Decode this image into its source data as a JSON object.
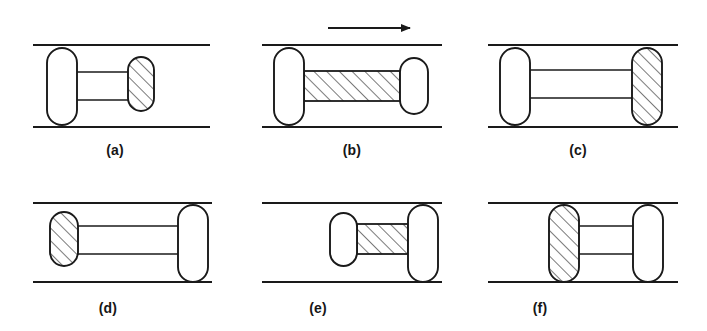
{
  "figure": {
    "type": "diagram",
    "background_color": "#ffffff",
    "line_color": "#1a1a1a",
    "hatch_color": "#333333",
    "panels": [
      {
        "id": "a",
        "label": "(a)",
        "label_x": 115,
        "label_y": 142,
        "wall_top_y": 45,
        "wall_bottom_y": 127,
        "wall_x_start": 33,
        "wall_x_end": 210,
        "arrow": null,
        "left_lobe": {
          "x": 47,
          "y": 48,
          "w": 30,
          "h": 77,
          "hatched": false,
          "spans_channel": true
        },
        "right_lobe": {
          "x": 128,
          "y": 57,
          "w": 26,
          "h": 54,
          "hatched": true,
          "spans_channel": false
        },
        "connector": {
          "style": "two-rods",
          "x1": 77,
          "x2": 128,
          "rod_top_y": 72,
          "rod_bottom_y": 100,
          "hatched": false
        }
      },
      {
        "id": "b",
        "label": "(b)",
        "label_x": 352,
        "label_y": 142,
        "wall_top_y": 45,
        "wall_bottom_y": 127,
        "wall_x_start": 262,
        "wall_x_end": 442,
        "arrow": {
          "x_start": 328,
          "x_end": 420,
          "y": 28,
          "direction": "right"
        },
        "left_lobe": {
          "x": 274,
          "y": 48,
          "w": 30,
          "h": 77,
          "hatched": false,
          "spans_channel": true
        },
        "right_lobe": {
          "x": 400,
          "y": 58,
          "w": 28,
          "h": 56,
          "hatched": false,
          "spans_channel": false
        },
        "connector": {
          "style": "hatched-bar",
          "x1": 304,
          "x2": 400,
          "rod_top_y": 71,
          "rod_bottom_y": 101,
          "hatched": true
        }
      },
      {
        "id": "c",
        "label": "(c)",
        "label_x": 578,
        "label_y": 142,
        "wall_top_y": 45,
        "wall_bottom_y": 127,
        "wall_x_start": 488,
        "wall_x_end": 678,
        "arrow": null,
        "left_lobe": {
          "x": 500,
          "y": 48,
          "w": 30,
          "h": 77,
          "hatched": false,
          "spans_channel": true
        },
        "right_lobe": {
          "x": 632,
          "y": 48,
          "w": 30,
          "h": 77,
          "hatched": true,
          "spans_channel": true
        },
        "connector": {
          "style": "two-rods",
          "x1": 530,
          "x2": 632,
          "rod_top_y": 70,
          "rod_bottom_y": 98,
          "hatched": false
        }
      },
      {
        "id": "d",
        "label": "(d)",
        "label_x": 108,
        "label_y": 300,
        "wall_top_y": 203,
        "wall_bottom_y": 282,
        "wall_x_start": 33,
        "wall_x_end": 212,
        "arrow": null,
        "left_lobe": {
          "x": 50,
          "y": 212,
          "w": 28,
          "h": 54,
          "hatched": true,
          "spans_channel": false
        },
        "right_lobe": {
          "x": 178,
          "y": 205,
          "w": 30,
          "h": 77,
          "hatched": false,
          "spans_channel": true
        },
        "connector": {
          "style": "two-rods",
          "x1": 78,
          "x2": 178,
          "rod_top_y": 226,
          "rod_bottom_y": 254,
          "hatched": false
        }
      },
      {
        "id": "e",
        "label": "(e)",
        "label_x": 318,
        "label_y": 300,
        "wall_top_y": 203,
        "wall_bottom_y": 282,
        "wall_x_start": 262,
        "wall_x_end": 442,
        "arrow": null,
        "left_lobe": {
          "x": 330,
          "y": 213,
          "w": 27,
          "h": 53,
          "hatched": false,
          "spans_channel": false
        },
        "right_lobe": {
          "x": 408,
          "y": 205,
          "w": 30,
          "h": 77,
          "hatched": false,
          "spans_channel": true
        },
        "connector": {
          "style": "hatched-bar",
          "x1": 357,
          "x2": 408,
          "rod_top_y": 224,
          "rod_bottom_y": 254,
          "hatched": true
        }
      },
      {
        "id": "f",
        "label": "(f)",
        "label_x": 540,
        "label_y": 300,
        "wall_top_y": 203,
        "wall_bottom_y": 282,
        "wall_x_start": 488,
        "wall_x_end": 678,
        "arrow": null,
        "left_lobe": {
          "x": 549,
          "y": 205,
          "w": 30,
          "h": 77,
          "hatched": true,
          "spans_channel": true
        },
        "right_lobe": {
          "x": 633,
          "y": 205,
          "w": 30,
          "h": 77,
          "hatched": false,
          "spans_channel": true
        },
        "connector": {
          "style": "two-rods",
          "x1": 579,
          "x2": 633,
          "rod_top_y": 226,
          "rod_bottom_y": 254,
          "hatched": false
        }
      }
    ]
  }
}
